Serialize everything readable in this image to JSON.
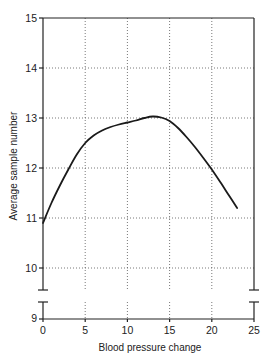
{
  "chart_data": {
    "type": "line",
    "title": "",
    "xlabel": "Blood pressure change",
    "ylabel": "Average sample number",
    "xlim": [
      0,
      25
    ],
    "ylim": [
      9,
      15
    ],
    "y_axis_break": "between 9 and 10",
    "grid": true,
    "grid_style": "dotted",
    "legend": null,
    "x_ticks": [
      "0",
      "5",
      "10",
      "15",
      "20",
      "25"
    ],
    "y_ticks": [
      "9",
      "10",
      "11",
      "12",
      "13",
      "14",
      "15"
    ],
    "series": [
      {
        "name": "Average sample number",
        "x": [
          0,
          1,
          2,
          3,
          4,
          5,
          6,
          7,
          8,
          9,
          10,
          11,
          12,
          13,
          14,
          15,
          16,
          17,
          18,
          19,
          20,
          21,
          22,
          23
        ],
        "values": [
          10.9,
          11.3,
          11.65,
          11.97,
          12.27,
          12.5,
          12.65,
          12.75,
          12.82,
          12.87,
          12.91,
          12.95,
          13.0,
          13.03,
          13.01,
          12.94,
          12.8,
          12.62,
          12.42,
          12.2,
          11.97,
          11.72,
          11.46,
          11.2
        ]
      }
    ]
  },
  "labels": {
    "xlabel": "Blood pressure change",
    "ylabel": "Average sample number",
    "x_ticks": [
      "0",
      "5",
      "10",
      "15",
      "20",
      "25"
    ],
    "y_ticks": [
      "9",
      "10",
      "11",
      "12",
      "13",
      "14",
      "15"
    ]
  }
}
